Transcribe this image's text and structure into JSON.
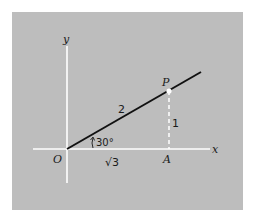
{
  "figure": {
    "background_color": "#bdbdbd",
    "axis_color": "#ffffff",
    "segment_color": "#111111",
    "labels": {
      "y_axis": "y",
      "x_axis": "x",
      "origin": "O",
      "point_p": "P",
      "point_a": "A",
      "hypotenuse": "2",
      "opposite": "1",
      "adjacent": "√3",
      "angle": "30°"
    }
  },
  "diagram_data": {
    "type": "right-triangle-on-axes",
    "angle_deg": 30,
    "hypotenuse_length": "2",
    "opposite_length": "1",
    "adjacent_length": "√3",
    "points": [
      "O",
      "P",
      "A"
    ]
  }
}
